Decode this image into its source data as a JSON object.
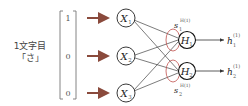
{
  "input_label": {
    "line1": "1文字目",
    "line2": "「さ」"
  },
  "input_vector": {
    "values": [
      "1",
      "0",
      "0"
    ]
  },
  "input_nodes": [
    {
      "symbol": "X",
      "sub": "1"
    },
    {
      "symbol": "X",
      "sub": "2"
    },
    {
      "symbol": "X",
      "sub": "3"
    }
  ],
  "hidden_nodes": [
    {
      "symbol": "H",
      "sub": "1"
    },
    {
      "symbol": "H",
      "sub": "2"
    }
  ],
  "sum_labels": [
    {
      "symbol": "s",
      "sub": "1",
      "sup": "H(1)"
    },
    {
      "symbol": "s",
      "sub": "2",
      "sup": "H(1)"
    }
  ],
  "outputs": [
    {
      "symbol": "h",
      "sub": "1",
      "sup": "(1)"
    },
    {
      "symbol": "h",
      "sub": "2",
      "sup": "(1)"
    }
  ],
  "colors": {
    "arrow": "#8a4a3c",
    "ellipse": "#c0504d",
    "lines": "#444444",
    "node_stroke": "#222222",
    "bracket": "#777777"
  }
}
